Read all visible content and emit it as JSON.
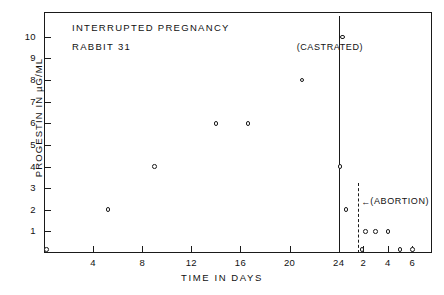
{
  "chart_data": {
    "type": "scatter",
    "title": "INTERRUPTED PREGNANCY",
    "subtitle": "RABBIT 31",
    "xlabel": "TIME  IN  DAYS",
    "ylabel": "PROGESTIN  IN  µG/ML",
    "grid": false,
    "legend": "none",
    "ylim": [
      0,
      11
    ],
    "ytick_labels": [
      "10",
      "9",
      "8",
      "7",
      "6",
      "5",
      "4",
      "3",
      "2",
      "1"
    ],
    "ytick_values": [
      10,
      9,
      8,
      7,
      6,
      5,
      4,
      3,
      2,
      1
    ],
    "xtick_labels": [
      "4",
      "8",
      "12",
      "16",
      "20",
      "24",
      "2",
      "4",
      "6"
    ],
    "xtick_values": [
      4,
      8,
      12,
      16,
      20,
      24,
      26,
      28,
      30
    ],
    "x_axis_note": "Axis restarts numbering at the castration event (day 24); post-event labels read 2, 4, 6",
    "series": [
      {
        "name": "progestin",
        "points": [
          {
            "x": 0.2,
            "y": 0.15
          },
          {
            "x": 5.2,
            "y": 2.0
          },
          {
            "x": 9.0,
            "y": 4.0
          },
          {
            "x": 14.0,
            "y": 6.0
          },
          {
            "x": 16.6,
            "y": 6.0
          },
          {
            "x": 21.0,
            "y": 8.0
          },
          {
            "x": 24.3,
            "y": 10.0
          },
          {
            "x": 24.1,
            "y": 4.0
          },
          {
            "x": 24.6,
            "y": 2.0
          },
          {
            "x": 25.9,
            "y": 0.15
          },
          {
            "x": 26.2,
            "y": 1.0
          },
          {
            "x": 27.0,
            "y": 1.0
          },
          {
            "x": 28.0,
            "y": 1.0
          },
          {
            "x": 29.0,
            "y": 0.15
          },
          {
            "x": 30.0,
            "y": 0.15
          }
        ]
      }
    ],
    "annotations": [
      {
        "label": "(CASTRATED)",
        "x": 24,
        "type": "vertical-line-solid"
      },
      {
        "label": "(ABORTION)",
        "x": 25.6,
        "type": "vertical-line-dashed",
        "arrow": "←"
      }
    ]
  },
  "labels": {
    "castrated": "(CASTRATED)",
    "abortion": "(ABORTION)",
    "arrow": "←"
  }
}
